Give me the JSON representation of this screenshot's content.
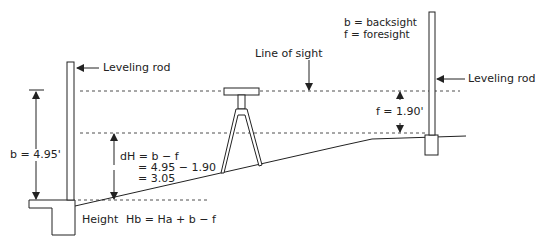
{
  "diagram": {
    "type": "differential-leveling",
    "labels": {
      "left_rod": "Leveling rod",
      "right_rod": "Leveling rod",
      "line_of_sight": "Line of sight",
      "legend_b": "b = backsight",
      "legend_f": "f = foresight",
      "backsight": "b = 4.95'",
      "foresight": "f = 1.90'",
      "dh_line1": "dH = b − f",
      "dh_line2": "= 4.95 − 1.90",
      "dh_line3": "= 3.05",
      "height_label": "Height",
      "height_formula": "Hb = Ha + b − f"
    },
    "values": {
      "backsight_ft": 4.95,
      "foresight_ft": 1.9,
      "difference_in_height_ft": 3.05
    },
    "colors": {
      "stroke": "#222222",
      "background": "#ffffff"
    }
  }
}
